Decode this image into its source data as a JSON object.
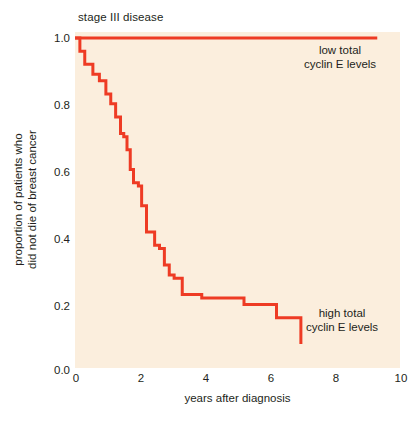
{
  "figure": {
    "panel_title": "stage III disease",
    "background_color": "#fbeedd",
    "line_color": "#ee3b24",
    "text_color": "#231f20"
  },
  "axes": {
    "x": {
      "label": "years after diagnosis",
      "ticks": [
        "0",
        "2",
        "4",
        "6",
        "8",
        "10"
      ],
      "tick_values": [
        0,
        2,
        4,
        6,
        8,
        10
      ],
      "range": [
        0,
        10
      ]
    },
    "y": {
      "label_line1": "proportion of patients who",
      "label_line2": "did not die of breast cancer",
      "ticks": [
        "1.0",
        "0.8",
        "0.6",
        "0.4",
        "0.2",
        "0.0"
      ],
      "tick_values": [
        1.0,
        0.8,
        0.6,
        0.4,
        0.2,
        0.0
      ],
      "range": [
        0,
        1
      ]
    }
  },
  "annotations": {
    "low": {
      "line1": "low total",
      "line2": "cyclin E levels"
    },
    "high": {
      "line1": "high total",
      "line2": "cyclin E levels"
    }
  },
  "chart_data": {
    "type": "line",
    "title": "stage III disease",
    "xlabel": "years after diagnosis",
    "ylabel": "proportion of patients who did not die of breast cancer",
    "xlim": [
      0,
      10
    ],
    "ylim": [
      0,
      1
    ],
    "grid": false,
    "legend": "inline annotations",
    "step_style": "post",
    "series": [
      {
        "name": "low total cyclin E levels",
        "color": "#ee3b24",
        "x": [
          0.0,
          9.3
        ],
        "y": [
          1.0,
          1.0
        ]
      },
      {
        "name": "high total cyclin E levels",
        "color": "#ee3b24",
        "x": [
          0.0,
          0.15,
          0.3,
          0.55,
          0.75,
          0.95,
          1.1,
          1.25,
          1.4,
          1.5,
          1.6,
          1.7,
          1.8,
          1.95,
          2.05,
          2.2,
          2.45,
          2.6,
          2.75,
          2.9,
          3.05,
          3.3,
          3.9,
          5.2,
          6.2,
          6.95
        ],
        "y": [
          1.0,
          0.96,
          0.92,
          0.89,
          0.87,
          0.83,
          0.8,
          0.76,
          0.71,
          0.7,
          0.66,
          0.6,
          0.56,
          0.55,
          0.49,
          0.41,
          0.37,
          0.36,
          0.31,
          0.28,
          0.27,
          0.22,
          0.21,
          0.19,
          0.15,
          0.07
        ]
      }
    ]
  }
}
